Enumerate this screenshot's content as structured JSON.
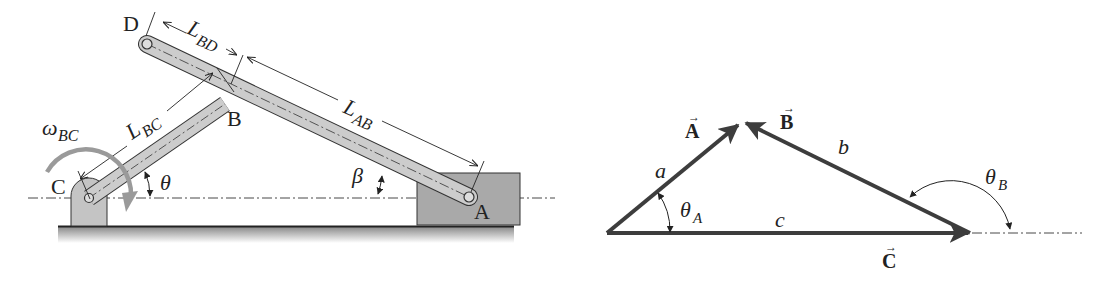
{
  "linkage": {
    "points": {
      "A": "A",
      "B": "B",
      "C": "C",
      "D": "D"
    },
    "dimensions": {
      "L_BD": {
        "main": "L",
        "sub": "BD"
      },
      "L_BC": {
        "main": "L",
        "sub": "BC"
      },
      "L_AB": {
        "main": "L",
        "sub": "AB"
      }
    },
    "angles": {
      "theta": "θ",
      "beta": "β",
      "omega": {
        "main": "ω",
        "sub": "BC"
      }
    },
    "colors": {
      "link_fill": "#cccccc",
      "slider_fill": "#a9a9a9",
      "support_fill": "#c4c4c4",
      "stroke": "#2a2a2a",
      "omega_arrow": "#9a9a9a"
    }
  },
  "vector_triangle": {
    "vectors": {
      "A": "A",
      "B": "B",
      "C": "C"
    },
    "vector_arrow_glyph": "→",
    "sides": {
      "a": "a",
      "b": "b",
      "c": "c"
    },
    "angles": {
      "theta_A": {
        "main": "θ",
        "sub": "A"
      },
      "theta_B": {
        "main": "θ",
        "sub": "B"
      }
    },
    "colors": {
      "vector_stroke": "#3d3d3d"
    }
  }
}
